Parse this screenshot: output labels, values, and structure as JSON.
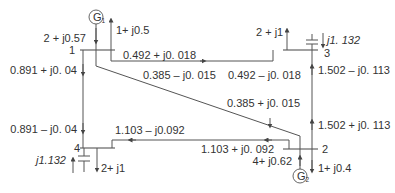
{
  "diagram": {
    "type": "power-flow-network",
    "buses": [
      {
        "id": "1",
        "label": "1"
      },
      {
        "id": "2",
        "label": "2"
      },
      {
        "id": "3",
        "label": "3"
      },
      {
        "id": "4",
        "label": "4"
      }
    ],
    "generators": [
      {
        "id": "G1",
        "label": "G",
        "sub": "1",
        "bus": "1",
        "injection": "2 + j0.57"
      },
      {
        "id": "G2",
        "label": "G",
        "sub": "2",
        "bus": "2",
        "injection": "4+ j0.62"
      }
    ],
    "loads": [
      {
        "bus": "1",
        "value": "1+ j0.5"
      },
      {
        "bus": "3",
        "value": "2 + j1"
      },
      {
        "bus": "4",
        "value": "2+ j1"
      },
      {
        "bus": "2",
        "value": "1+ j0.4"
      }
    ],
    "shunt_capacitors": [
      {
        "bus": "3",
        "value": "j1. 132"
      },
      {
        "bus": "4",
        "value": "j1.132"
      }
    ],
    "line_flows": {
      "l13_from": "0.492 + j0. 018",
      "l13_to": "0.492 – j0. 018",
      "l12_from": "0.385 – j0. 015",
      "l12_to": "0.385 + j0. 015",
      "l14_from": "0.891 + j0. 04",
      "l14_to": "0.891 – j0. 04",
      "l32_from": "1.502 – j0. 113",
      "l32_to": "1.502 + j0. 113",
      "l24_from": "1.103 + j0. 092",
      "l24_to": "1.103 – j0.092"
    }
  }
}
